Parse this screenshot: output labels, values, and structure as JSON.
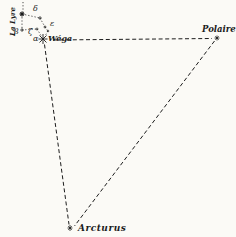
{
  "figure": {
    "background_color": "#fbfaf6",
    "ink_color": "#1c1c1c",
    "constellation": {
      "name": "La Lyre",
      "star_labels": {
        "alpha": "α",
        "beta": "β",
        "zeta": "ζ",
        "delta": "δ",
        "epsilon": "ε"
      },
      "vega_name": "Wéga"
    },
    "triangle_stars": {
      "polaris": "Polaire",
      "arcturus": "Arcturus"
    }
  }
}
